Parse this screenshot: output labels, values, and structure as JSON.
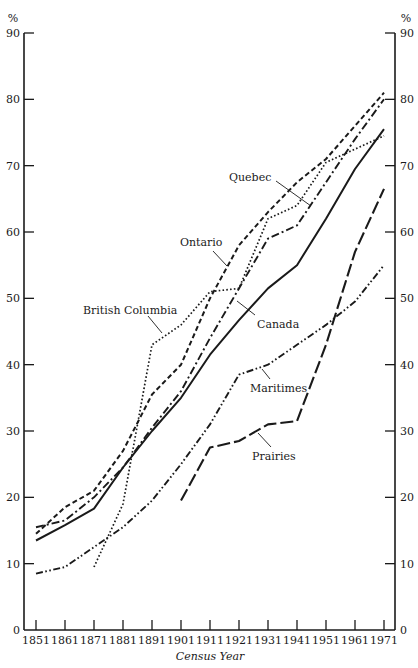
{
  "chart_data": {
    "type": "line",
    "title": "",
    "xlabel": "Census Year",
    "ylabel": "%",
    "ylim": [
      0,
      90
    ],
    "yticks": [
      0,
      10,
      20,
      30,
      40,
      50,
      60,
      70,
      80,
      90
    ],
    "y_axis_both_sides": true,
    "grid": false,
    "legend": "inline labels with leader lines",
    "categories": [
      "1851",
      "1861",
      "1871",
      "1881",
      "1891",
      "1901",
      "1911",
      "1921",
      "1931",
      "1941",
      "1951",
      "1961",
      "1971"
    ],
    "series": [
      {
        "name": "Canada",
        "style": "solid",
        "values": [
          13.5,
          15.8,
          18.3,
          24.5,
          30.0,
          35.0,
          41.5,
          46.7,
          51.5,
          55.0,
          62.0,
          69.5,
          75.5
        ]
      },
      {
        "name": "Ontario",
        "style": "short-dash",
        "values": [
          14.5,
          18.5,
          21.0,
          27.0,
          35.5,
          40.0,
          50.0,
          58.0,
          63.0,
          67.5,
          71.0,
          76.0,
          81.0
        ]
      },
      {
        "name": "Quebec",
        "style": "dash-dot",
        "values": [
          15.5,
          16.5,
          20.0,
          24.5,
          30.5,
          36.0,
          44.0,
          51.5,
          59.0,
          61.0,
          67.5,
          74.0,
          80.0
        ]
      },
      {
        "name": "British Columbia",
        "style": "dotted",
        "values": [
          null,
          null,
          9.5,
          19.0,
          43.0,
          46.0,
          51.0,
          51.5,
          62.0,
          64.0,
          70.5,
          72.5,
          74.5
        ]
      },
      {
        "name": "Maritimes",
        "style": "dash-dot-dot",
        "values": [
          8.5,
          9.5,
          12.5,
          15.5,
          19.5,
          25.0,
          31.0,
          38.5,
          40.0,
          43.0,
          46.0,
          49.5,
          55.0
        ]
      },
      {
        "name": "Prairies",
        "style": "long-dash",
        "values": [
          null,
          null,
          null,
          null,
          null,
          19.5,
          27.5,
          28.5,
          31.0,
          31.5,
          43.0,
          57.0,
          66.5
        ]
      }
    ],
    "annotations": [
      {
        "text": "Quebec",
        "x": 229,
        "y": 181,
        "leader": [
          [
            276,
            181
          ],
          [
            311,
            206
          ]
        ]
      },
      {
        "text": "Ontario",
        "x": 180,
        "y": 246,
        "leader": [
          [
            213,
            251
          ],
          [
            227,
            266
          ]
        ]
      },
      {
        "text": "British Columbia",
        "x": 83,
        "y": 314,
        "leader": [
          [
            148,
            316
          ],
          [
            162,
            333
          ]
        ]
      },
      {
        "text": "Canada",
        "x": 257,
        "y": 328,
        "leader": [
          [
            255,
            315
          ],
          [
            237,
            301
          ]
        ]
      },
      {
        "text": "Maritimes",
        "x": 250,
        "y": 392,
        "leader": [
          [
            270,
            379
          ],
          [
            262,
            369
          ]
        ]
      },
      {
        "text": "Prairies",
        "x": 252,
        "y": 460,
        "leader": [
          [
            271,
            447
          ],
          [
            258,
            433
          ]
        ]
      }
    ]
  },
  "axes": {
    "y_unit_left": "%",
    "y_unit_right": "%",
    "x_title": "Census Year"
  },
  "colors": {
    "ink": "#1a1a1a",
    "background": "#ffffff"
  }
}
